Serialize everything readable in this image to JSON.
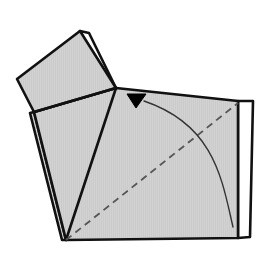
{
  "figure": {
    "type": "line-drawing",
    "background_color": "#ffffff",
    "paper_front_color": "#cccccc",
    "paper_back_color": "#ffffff",
    "outline_color": "#111111",
    "crease_color": "#555555",
    "arrow_color": "#000000",
    "outline_width": 2.6,
    "thin_line_width": 1.2,
    "canvas": {
      "width": 274,
      "height": 260
    }
  },
  "shapes": {
    "back_layer_right": {
      "label": "back layer right sliver",
      "fill": "#ffffff",
      "points": "238,101 253,101 250,237 238,238"
    },
    "back_layer_flap": {
      "label": "back layer under upper flap",
      "fill": "#ffffff",
      "points": "80,31 89,33 116,88 110,86"
    },
    "main_body": {
      "label": "main folded square body",
      "fill": "#cccccc",
      "points": "116,88 238,101 238,238 66,240 34,112"
    },
    "lower_left_layer": {
      "label": "lower left under layer",
      "fill": "#cccccc",
      "points": "34,112 66,240 62,240 30,113"
    },
    "upper_flap": {
      "label": "upper folded flap",
      "fill": "#cccccc",
      "points": "80,31 116,88 17,79 17,79"
    },
    "upper_flap_full": {
      "label": "upper folded flap quadrilateral",
      "fill": "#cccccc",
      "points": "80,31 116,88 34,112 17,79"
    },
    "inner_triangle": {
      "label": "inner triangular layer",
      "fill": "#cccccc",
      "points": "116,88 66,240 34,112"
    }
  },
  "lines": {
    "fold_edge_center_to_bottom_left": {
      "label": "crease from center vertex to bottom left corner",
      "from": "116,88",
      "to": "66,240"
    },
    "fold_edge_center_to_left": {
      "label": "crease from center vertex to left corner",
      "from": "116,88",
      "to": "34,112"
    },
    "left_under_edge": {
      "label": "second left layer edge",
      "from": "30,113",
      "to": "62,240"
    }
  },
  "crease_dashed": {
    "label": "valley fold dashed diagonal",
    "from": "66,240",
    "to": "238,103",
    "dash_pattern": "7 5"
  },
  "motion_arrow": {
    "label": "fold motion arrow",
    "curve_start": "233,227",
    "curve_control": "213,120",
    "curve_end": "143,101",
    "arrowhead": {
      "label": "solid black triangle arrowhead pointing down",
      "points": "127,94 146,94 136,108"
    }
  }
}
